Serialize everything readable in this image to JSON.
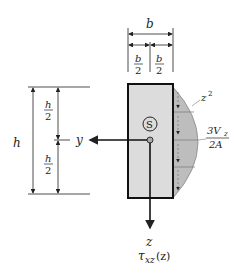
{
  "diagram": {
    "labels": {
      "b": "b",
      "b_half_num": "b",
      "b_half_den": "2",
      "h": "h",
      "h_half_num": "h",
      "h_half_den": "2",
      "y_axis": "y",
      "z_axis": "z",
      "centroid": "S",
      "parabola": "z",
      "parabola_exp": "2",
      "max_num": "3V",
      "max_num_sub": "z",
      "max_den": "2A",
      "tau": "τ",
      "tau_sub": "xz",
      "tau_arg": "(z)"
    },
    "colors": {
      "section_fill": "#dcdcdc",
      "stress_fill": "#b8b8b8",
      "outline": "#111111"
    }
  }
}
